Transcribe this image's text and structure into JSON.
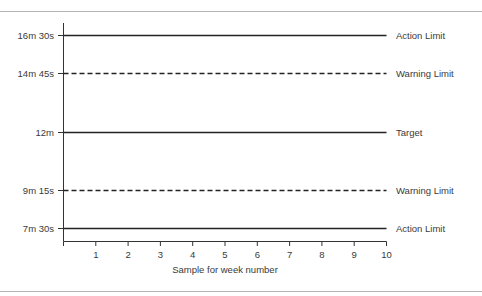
{
  "chart_data": {
    "type": "line",
    "title": "",
    "xlabel": "Sample for week number",
    "ylabel": "",
    "x_ticks": [
      "1",
      "2",
      "3",
      "4",
      "5",
      "6",
      "7",
      "8",
      "9",
      "10"
    ],
    "xlim": [
      0,
      10
    ],
    "y_tick_labels": [
      "16m 30s",
      "14m 45s",
      "12m",
      "9m 15s",
      "7m 30s"
    ],
    "y_values_seconds": [
      990,
      885,
      720,
      555,
      450
    ],
    "grid": false,
    "series": [
      {
        "name": "Action Limit",
        "label": "Action Limit",
        "value": "16m 30s",
        "seconds": 990,
        "style": "solid"
      },
      {
        "name": "Warning Limit",
        "label": "Warning Limit",
        "value": "14m 45s",
        "seconds": 885,
        "style": "dashed"
      },
      {
        "name": "Target",
        "label": "Target",
        "value": "12m",
        "seconds": 720,
        "style": "solid"
      },
      {
        "name": "Warning Limit",
        "label": "Warning Limit",
        "value": "9m 15s",
        "seconds": 555,
        "style": "dashed"
      },
      {
        "name": "Action Limit",
        "label": "Action Limit",
        "value": "7m 30s",
        "seconds": 450,
        "style": "solid"
      }
    ],
    "line_color": "#222222"
  }
}
